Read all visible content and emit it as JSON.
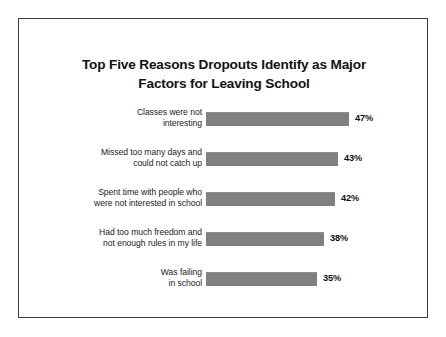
{
  "chart_data": {
    "type": "bar",
    "orientation": "horizontal",
    "title": "Top Five Reasons Dropouts Identify as Major Factors for Leaving School",
    "title_lines": [
      "Top Five Reasons Dropouts Identify as Major",
      "Factors for Leaving School"
    ],
    "xlabel": "",
    "ylabel": "",
    "grid": false,
    "legend": false,
    "value_suffix": "%",
    "bar_color": "#808080",
    "categories": [
      "Classes were not interesting",
      "Missed too many days and could not catch up",
      "Spent time with people who were not interested in school",
      "Had too much freedom and not enough rules in my life",
      "Was failing in school"
    ],
    "values": [
      47,
      43,
      42,
      38,
      35
    ],
    "value_labels": [
      "47%",
      "43%",
      "42%",
      "38%",
      "35%"
    ],
    "xlim": [
      0,
      47
    ],
    "bars": [
      {
        "label_lines": [
          "Classes were not",
          "interesting"
        ],
        "value": 47,
        "value_label": "47%",
        "bar_width_px": 143
      },
      {
        "label_lines": [
          "Missed too many days and",
          "could not catch up"
        ],
        "value": 43,
        "value_label": "43%",
        "bar_width_px": 132
      },
      {
        "label_lines": [
          "Spent time with people who",
          "were not interested in school"
        ],
        "value": 42,
        "value_label": "42%",
        "bar_width_px": 129
      },
      {
        "label_lines": [
          "Had too much freedom and",
          "not enough rules in my life"
        ],
        "value": 38,
        "value_label": "38%",
        "bar_width_px": 118
      },
      {
        "label_lines": [
          "Was failing",
          "in school"
        ],
        "value": 35,
        "value_label": "35%",
        "bar_width_px": 111
      }
    ]
  }
}
